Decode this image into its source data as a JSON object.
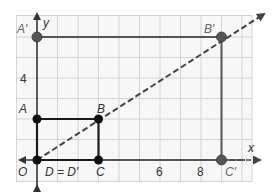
{
  "diagram": {
    "type": "coordinate-plane-dilation",
    "axes": {
      "x_label": "x",
      "y_label": "y",
      "origin_label": "O"
    },
    "ticks": {
      "x": [
        "6",
        "8"
      ],
      "y": [
        "4"
      ]
    },
    "points": {
      "A": {
        "label": "A",
        "coords": [
          0,
          2
        ]
      },
      "B": {
        "label": "B",
        "coords": [
          3,
          2
        ]
      },
      "C": {
        "label": "C",
        "coords": [
          3,
          0
        ]
      },
      "D": {
        "label": "D = D′",
        "coords": [
          0,
          0
        ]
      },
      "A_prime": {
        "label": "A′",
        "coords": [
          0,
          7
        ]
      },
      "B_prime": {
        "label": "B′",
        "coords": [
          9,
          7
        ]
      },
      "C_prime": {
        "label": "C′",
        "coords": [
          9,
          0
        ]
      }
    },
    "colors": {
      "grid": "#d4d4d4",
      "grid_bg": "#f7f7f7",
      "original": "#1a1a1a",
      "image": "#555555",
      "dashed_ray": "#444444"
    }
  }
}
